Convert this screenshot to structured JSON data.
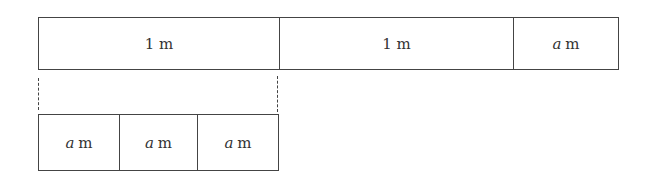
{
  "top_bar": {
    "segments": [
      {
        "var": "",
        "value": "1 m"
      },
      {
        "var": "",
        "value": "1 m"
      },
      {
        "var": "a",
        "value": "m"
      }
    ]
  },
  "bottom_bar": {
    "segments": [
      {
        "var": "a",
        "value": "m"
      },
      {
        "var": "a",
        "value": "m"
      },
      {
        "var": "a",
        "value": "m"
      }
    ]
  }
}
